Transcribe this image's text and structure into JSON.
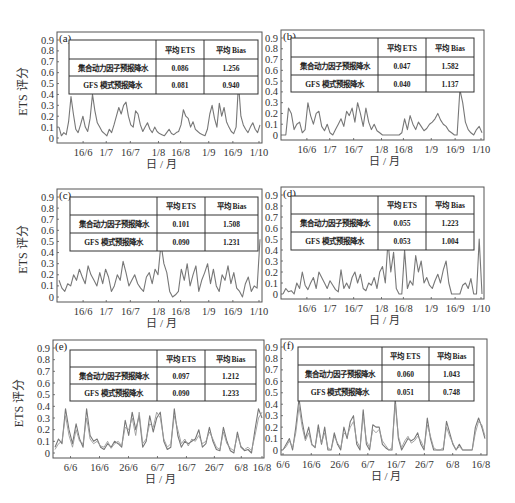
{
  "figure": {
    "ylabel": "ETS 评分",
    "xlabel": "日 / 月",
    "table_headers": [
      "",
      "平均 ETS",
      "平均 Bias"
    ],
    "row_labels": [
      "集合动力因子预报降水",
      "GFS 模式预报降水"
    ],
    "line_color": "#777777",
    "frame_color": "#555555"
  },
  "chart_data": [
    {
      "type": "line",
      "panel": "(a)",
      "ylabel": "ETS 评分",
      "xlabel": "日 / 月",
      "ylim": [
        0,
        0.9
      ],
      "yticks": [
        "0",
        "0.1",
        "0.2",
        "0.3",
        "0.4",
        "0.5",
        "0.6",
        "0.7",
        "0.8",
        "0.9"
      ],
      "xticks": [
        "16/6",
        "1/7",
        "16/7",
        "1/8",
        "16/8",
        "1/9",
        "16/9",
        "1/10"
      ],
      "xtick_pos": [
        0.12,
        0.235,
        0.355,
        0.495,
        0.605,
        0.745,
        0.865,
        0.995
      ],
      "table": {
        "rows": [
          [
            "集合动力因子预报降水",
            "0.086",
            "1.256"
          ],
          [
            "GFS 模式预报降水",
            "0.081",
            "0.940"
          ]
        ]
      },
      "series": [
        {
          "name": "ETS",
          "values": [
            0.1,
            0.02,
            0.05,
            0.03,
            0.15,
            0.38,
            0.22,
            0.08,
            0.05,
            0.12,
            0.2,
            0.1,
            0.06,
            0.18,
            0.4,
            0.25,
            0.14,
            0.1,
            0.06,
            0.04,
            0.02,
            0.08,
            0.05,
            0.12,
            0.2,
            0.28,
            0.22,
            0.3,
            0.33,
            0.2,
            0.12,
            0.1,
            0.25,
            0.22,
            0.12,
            0.06,
            0.1,
            0.14,
            0.08,
            0.05,
            0.1,
            0.06,
            0.04,
            0.03,
            0.02,
            0.05,
            0.08,
            0.04,
            0.03,
            0.05,
            0.06,
            0.12,
            0.26,
            0.2,
            0.18,
            0.1,
            0.15,
            0.08,
            0.06,
            0.04,
            0.03,
            0.02,
            0.08,
            0.22,
            0.3,
            0.18,
            0.1,
            0.32,
            0.2,
            0.28,
            0.15,
            0.1,
            0.06,
            0.04,
            0.1,
            0.5,
            0.2,
            0.12,
            0.08,
            0.05,
            0.1,
            0.14,
            0.08,
            0.05,
            0.12
          ]
        }
      ]
    },
    {
      "type": "line",
      "panel": "(b)",
      "ylabel": "",
      "xlabel": "日 / 月",
      "ylim": [
        0,
        0.9
      ],
      "yticks": [
        "0",
        "0.1",
        "0.2",
        "0.3",
        "0.4",
        "0.5",
        "0.6",
        "0.7",
        "0.8",
        "0.9"
      ],
      "xticks": [
        "16/6",
        "1/7",
        "16/7",
        "1/8",
        "16/8",
        "1/9",
        "16/9",
        "1/10"
      ],
      "xtick_pos": [
        0.12,
        0.235,
        0.355,
        0.495,
        0.605,
        0.745,
        0.865,
        0.995
      ],
      "table": {
        "rows": [
          [
            "集合动力因子预报降水",
            "0.047",
            "1.582"
          ],
          [
            "GFS 模式预报降水",
            "0.040",
            "1.137"
          ]
        ]
      },
      "series": [
        {
          "name": "ETS",
          "values": [
            0,
            0.0,
            0.25,
            0.2,
            0.05,
            0.1,
            0.12,
            0.02,
            0.05,
            0.3,
            0.18,
            0.1,
            0.2,
            0.22,
            0.08,
            0.04,
            0.1,
            0.02,
            0.0,
            0.05,
            0.1,
            0.15,
            0.08,
            0.22,
            0.18,
            0.25,
            0.12,
            0.3,
            0.2,
            0.08,
            0.25,
            0.12,
            0.05,
            0.1,
            0.04,
            0.02,
            0.0,
            0.0,
            0.0,
            0.0,
            0.0,
            0.0,
            0.0,
            0.02,
            0.15,
            0.05,
            0.18,
            0.1,
            0.05,
            0.12,
            0.08,
            0.04,
            0.06,
            0.1,
            0.12,
            0.15,
            0.2,
            0.14,
            0.1,
            0.08,
            0.04,
            0.02,
            0.0,
            0.0,
            0.42,
            0.3,
            0.12,
            0.05,
            0.02,
            0.0,
            0.05,
            0.08,
            0.02
          ]
        }
      ]
    },
    {
      "type": "line",
      "panel": "(c)",
      "ylabel": "ETS 评分",
      "xlabel": "日 / 月",
      "ylim": [
        0,
        0.9
      ],
      "yticks": [
        "0",
        "0.1",
        "0.2",
        "0.3",
        "0.4",
        "0.5",
        "0.6",
        "0.7",
        "0.8",
        "0.9"
      ],
      "xticks": [
        "16/6",
        "1/7",
        "16/7",
        "1/8",
        "16/8",
        "1/9",
        "16/9",
        "1/10"
      ],
      "xtick_pos": [
        0.12,
        0.235,
        0.355,
        0.495,
        0.605,
        0.745,
        0.865,
        0.995
      ],
      "table": {
        "rows": [
          [
            "集合动力因子预报降水",
            "0.101",
            "1.508"
          ],
          [
            "GFS 模式预报降水",
            "0.090",
            "1.231"
          ]
        ]
      },
      "series": [
        {
          "name": "ETS",
          "values": [
            0.15,
            0.08,
            0.05,
            0.12,
            0.1,
            0.2,
            0.15,
            0.25,
            0.18,
            0.12,
            0.28,
            0.2,
            0.15,
            0.1,
            0.22,
            0.12,
            0.25,
            0.18,
            0.05,
            0.1,
            0.2,
            0.15,
            0.32,
            0.22,
            0.1,
            0.15,
            0.2,
            0.12,
            0.08,
            0.05,
            0.18,
            0.22,
            0.12,
            0.25,
            0.2,
            0.48,
            0.3,
            0.22,
            0.05,
            0.0,
            0.02,
            0.05,
            0.25,
            0.15,
            0.3,
            0.1,
            0.2,
            0.28,
            0.05,
            0.15,
            0.22,
            0.3,
            0.12,
            0.25,
            0.1,
            0.05,
            0.2,
            0.15,
            0.28,
            0.12,
            0.22,
            0.08,
            0.05,
            0.0,
            0.12,
            0.18,
            0.05,
            0.1,
            0.08,
            0.52
          ]
        }
      ]
    },
    {
      "type": "line",
      "panel": "(d)",
      "ylabel": "",
      "xlabel": "日 / 月",
      "ylim": [
        0,
        0.9
      ],
      "yticks": [
        "0",
        "0.1",
        "0.2",
        "0.3",
        "0.4",
        "0.5",
        "0.6",
        "0.7",
        "0.8",
        "0.9"
      ],
      "xticks": [
        "16/6",
        "1/7",
        "16/7",
        "1/8",
        "16/8",
        "1/9",
        "16/9",
        "1/10"
      ],
      "xtick_pos": [
        0.12,
        0.235,
        0.355,
        0.495,
        0.605,
        0.745,
        0.865,
        0.995
      ],
      "table": {
        "rows": [
          [
            "集合动力因子预报降水",
            "0.055",
            "1.223"
          ],
          [
            "GFS 模式预报降水",
            "0.053",
            "1.004"
          ]
        ]
      },
      "series": [
        {
          "name": "ETS",
          "values": [
            0.0,
            0.05,
            0.02,
            0.03,
            0.0,
            0.1,
            0.05,
            0.2,
            0.08,
            0.04,
            0.1,
            0.15,
            0.05,
            0.2,
            0.15,
            0.1,
            0.05,
            0.12,
            0.08,
            0.04,
            0.02,
            0.22,
            0.05,
            0.1,
            0.05,
            0.15,
            0.2,
            0.1,
            0.18,
            0.05,
            0.03,
            0.1,
            0.08,
            0.15,
            0.05,
            0.2,
            0.25,
            0.1,
            0.48,
            0.2,
            0.38,
            0.05,
            0.0,
            0.0,
            0.4,
            0.05,
            0.12,
            0.08,
            0.35,
            0.2,
            0.3,
            0.1,
            0.15,
            0.08,
            0.05,
            0.12,
            0.18,
            0.1,
            0.22,
            0.3,
            0.1,
            0.0,
            0.0,
            0.0,
            0.0,
            0.08,
            0.1,
            0.05,
            0.14,
            0.0,
            0.0,
            0.5,
            0.0
          ]
        }
      ]
    },
    {
      "type": "line",
      "panel": "(e)",
      "ylabel": "ETS 评分",
      "xlabel": "日 / 月",
      "ylim": [
        0,
        0.9
      ],
      "yticks": [
        "0",
        "0.1",
        "0.2",
        "0.3",
        "0.4",
        "0.5",
        "0.6",
        "0.7",
        "0.8",
        "0.9"
      ],
      "xticks": [
        "6/6",
        "16/6",
        "26/6",
        "6/7",
        "16/7",
        "26/7",
        "6/8",
        "16/8"
      ],
      "xtick_pos": [
        0.075,
        0.215,
        0.355,
        0.495,
        0.635,
        0.77,
        0.9,
        1.0
      ],
      "table": {
        "rows": [
          [
            "集合动力因子预报降水",
            "0.097",
            "1.212"
          ],
          [
            "GFS 模式预报降水",
            "0.090",
            "1.233"
          ]
        ]
      },
      "series": [
        {
          "name": "集合动力因子",
          "values": [
            0.05,
            0.12,
            0.08,
            0.38,
            0.2,
            0.08,
            0.25,
            0.12,
            0.05,
            0.38,
            0.15,
            0.1,
            0.12,
            0.05,
            0.03,
            0.08,
            0.05,
            0.1,
            0.08,
            0.05,
            0.28,
            0.15,
            0.35,
            0.2,
            0.32,
            0.05,
            0.1,
            0.32,
            0.18,
            0.3,
            0.35,
            0.1,
            0.03,
            0.05,
            0.38,
            0.15,
            0.05,
            0.1,
            0.08,
            0.1,
            0.12,
            0.2,
            0.05,
            0.08,
            0.22,
            0.1,
            0.03,
            0.02,
            0.22,
            0.1,
            0.02,
            0.0,
            0.18,
            0.05,
            0.02,
            0.03,
            0.0,
            0.2,
            0.38,
            0.3
          ]
        },
        {
          "name": "GFS",
          "values": [
            0.03,
            0.08,
            0.1,
            0.32,
            0.15,
            0.05,
            0.2,
            0.1,
            0.08,
            0.3,
            0.12,
            0.08,
            0.1,
            0.06,
            0.05,
            0.1,
            0.04,
            0.08,
            0.1,
            0.06,
            0.22,
            0.2,
            0.3,
            0.15,
            0.35,
            0.08,
            0.12,
            0.25,
            0.22,
            0.35,
            0.3,
            0.12,
            0.05,
            0.08,
            0.32,
            0.2,
            0.08,
            0.12,
            0.06,
            0.12,
            0.1,
            0.15,
            0.08,
            0.1,
            0.18,
            0.12,
            0.05,
            0.03,
            0.18,
            0.08,
            0.04,
            0.02,
            0.15,
            0.06,
            0.03,
            0.05,
            0.02,
            0.15,
            0.3,
            0.35
          ]
        }
      ]
    },
    {
      "type": "line",
      "panel": "(f)",
      "ylabel": "",
      "xlabel": "日 / 月",
      "ylim": [
        0,
        0.9
      ],
      "yticks": [
        "0",
        "0.1",
        "0.2",
        "0.3",
        "0.4",
        "0.5",
        "0.6",
        "0.7",
        "0.8",
        "0.9"
      ],
      "xticks": [
        "6/6",
        "16/6",
        "26/6",
        "6/7",
        "16/7",
        "26/7",
        "6/8",
        "16/8"
      ],
      "xtick_pos": [
        0.0,
        0.14,
        0.28,
        0.42,
        0.56,
        0.7,
        0.84,
        0.98
      ],
      "table": {
        "rows": [
          [
            "集合动力因子预报降水",
            "0.060",
            "1.043"
          ],
          [
            "GFS 模式预报降水",
            "0.051",
            "0.748"
          ]
        ]
      },
      "series": [
        {
          "name": "集合动力因子",
          "values": [
            0.0,
            0.05,
            0.1,
            0.0,
            0.2,
            0.45,
            0.25,
            0.1,
            0.2,
            0.05,
            0.02,
            0.22,
            0.05,
            0.2,
            0.0,
            0.0,
            0.15,
            0.05,
            0.0,
            0.2,
            0.1,
            0.25,
            0.3,
            0.05,
            0.0,
            0.35,
            0.05,
            0.0,
            0.22,
            0.2,
            0.2,
            0.05,
            0.02,
            0.0,
            0.0,
            0.45,
            0.1,
            0.0,
            0.05,
            0.1,
            0.08,
            0.1,
            0.15,
            0.05,
            0.0,
            0.28,
            0.1,
            0.0,
            0.0,
            0.0,
            0.0,
            0.25,
            0.15,
            0.05,
            0.0,
            0.05,
            0.0,
            0.0,
            0.0,
            0.0,
            0.2,
            0.28,
            0.2,
            0.1
          ]
        },
        {
          "name": "GFS",
          "values": [
            0.0,
            0.03,
            0.08,
            0.02,
            0.15,
            0.38,
            0.2,
            0.08,
            0.15,
            0.04,
            0.03,
            0.18,
            0.06,
            0.15,
            0.02,
            0.0,
            0.12,
            0.06,
            0.02,
            0.15,
            0.12,
            0.2,
            0.25,
            0.08,
            0.02,
            0.3,
            0.08,
            0.02,
            0.18,
            0.15,
            0.18,
            0.08,
            0.04,
            0.0,
            0.02,
            0.4,
            0.12,
            0.02,
            0.08,
            0.12,
            0.06,
            0.08,
            0.12,
            0.08,
            0.02,
            0.22,
            0.12,
            0.02,
            0.0,
            0.0,
            0.02,
            0.2,
            0.12,
            0.06,
            0.0,
            0.03,
            0.0,
            0.0,
            0.0,
            0.0,
            0.15,
            0.25,
            0.22,
            0.12
          ]
        }
      ]
    }
  ]
}
